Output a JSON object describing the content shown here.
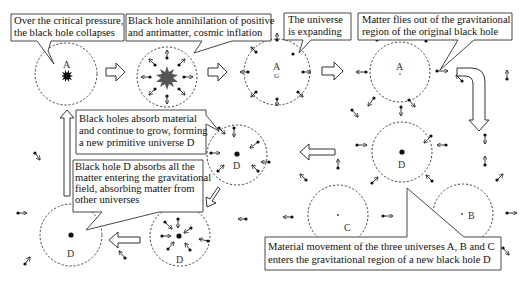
{
  "diagram": {
    "callouts": [
      {
        "id": "critical-pressure",
        "lines": [
          "Over the critical pressure,",
          "the black hole collapses"
        ]
      },
      {
        "id": "annihilation",
        "lines": [
          "Black hole annihilation of positive",
          "and antimatter, cosmic inflation"
        ]
      },
      {
        "id": "expanding",
        "lines": [
          "The universe",
          "is expanding"
        ]
      },
      {
        "id": "matter-flies",
        "lines": [
          "Matter flies out of the gravitational",
          "region of the original black hole"
        ]
      },
      {
        "id": "absorb-grow",
        "lines": [
          "Black holes absorb material",
          "and continue to grow, forming",
          "a new primitive universe D"
        ]
      },
      {
        "id": "absorb-all",
        "lines": [
          "Black hole D absorbs all the",
          "matter entering the gravitational",
          "field, absorbing matter from",
          "other universes"
        ]
      },
      {
        "id": "three-universes",
        "lines": [
          "Material movement of the three universes A, B and C",
          "enters the gravitational region of a new black hole D"
        ]
      }
    ],
    "universe_labels": {
      "a1": "A",
      "a3": "A",
      "a3_sub": "G",
      "a4": "A",
      "d_right": "D",
      "d_mid": "D",
      "d_bottom_mid": "D",
      "d_bottom_left": "D",
      "b": "B",
      "c": "C"
    }
  }
}
